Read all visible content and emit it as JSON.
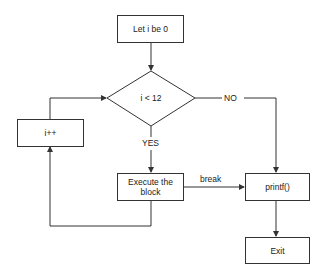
{
  "diagram": {
    "type": "flowchart",
    "nodes": {
      "start": {
        "label": "Let i be 0",
        "shape": "rectangle"
      },
      "condition": {
        "label": "i < 12",
        "shape": "diamond"
      },
      "increment": {
        "label": "i++",
        "shape": "rectangle"
      },
      "execute": {
        "label": "Execute the block",
        "shape": "rectangle"
      },
      "print": {
        "label": "printf()",
        "shape": "rectangle"
      },
      "exit": {
        "label": "Exit",
        "shape": "rectangle"
      }
    },
    "edges": [
      {
        "from": "start",
        "to": "condition",
        "label": ""
      },
      {
        "from": "condition",
        "to": "execute",
        "label": "YES"
      },
      {
        "from": "condition",
        "to": "print",
        "label": "NO"
      },
      {
        "from": "execute",
        "to": "print",
        "label": "break"
      },
      {
        "from": "execute",
        "to": "increment",
        "label": ""
      },
      {
        "from": "increment",
        "to": "condition",
        "label": ""
      },
      {
        "from": "print",
        "to": "exit",
        "label": ""
      }
    ],
    "edge_labels": {
      "yes": "YES",
      "no": "NO",
      "break": "break"
    },
    "colors": {
      "stroke": "#333333",
      "background": "#ffffff"
    }
  }
}
